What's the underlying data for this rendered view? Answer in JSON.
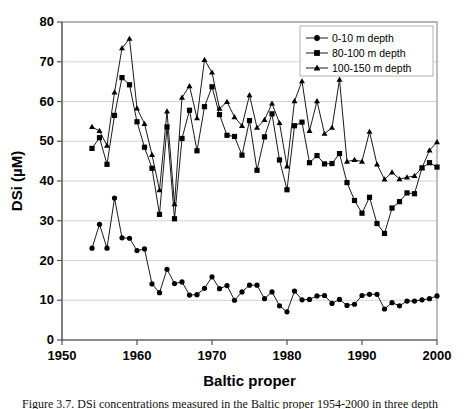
{
  "figure": {
    "caption_partial": "Figure 3.7. DSi concentrations measured in the Baltic proper 1954-2000 in three depth"
  },
  "chart_data": {
    "type": "line",
    "title": "",
    "xlabel": "Baltic proper",
    "ylabel": "DSi (µM)",
    "xlim": [
      1950,
      2000
    ],
    "ylim": [
      0,
      80
    ],
    "xticks": [
      1950,
      1960,
      1970,
      1980,
      1990,
      2000
    ],
    "yticks": [
      0,
      10,
      20,
      30,
      40,
      50,
      60,
      70,
      80
    ],
    "grid": "horizontal",
    "legend_position": "top-right",
    "series": [
      {
        "name": "0-10 m depth",
        "marker": "circle",
        "color": "#000000",
        "x": [
          1954,
          1955,
          1956,
          1957,
          1958,
          1959,
          1960,
          1961,
          1962,
          1963,
          1964,
          1965,
          1966,
          1967,
          1968,
          1969,
          1970,
          1971,
          1972,
          1973,
          1974,
          1975,
          1976,
          1977,
          1978,
          1979,
          1980,
          1981,
          1982,
          1983,
          1984,
          1985,
          1986,
          1987,
          1988,
          1989,
          1990,
          1991,
          1992,
          1993,
          1994,
          1995,
          1996,
          1997,
          1998,
          1999,
          2000
        ],
        "values": [
          23.1,
          29.1,
          23.1,
          35.7,
          25.7,
          25.6,
          22.5,
          22.9,
          14.1,
          11.9,
          17.8,
          14.2,
          14.6,
          11.3,
          11.4,
          13.0,
          15.9,
          12.9,
          13.7,
          10.0,
          12.1,
          13.8,
          13.8,
          10.4,
          12.1,
          8.6,
          7.1,
          12.3,
          10.1,
          10.2,
          11.1,
          11.2,
          9.2,
          10.2,
          8.7,
          9.0,
          11.2,
          11.5,
          11.5,
          7.8,
          9.4,
          8.6,
          9.8,
          9.8,
          10.1,
          10.4,
          11.1
        ]
      },
      {
        "name": "80-100 m depth",
        "marker": "square",
        "color": "#000000",
        "x": [
          1954,
          1955,
          1956,
          1957,
          1958,
          1959,
          1960,
          1961,
          1962,
          1963,
          1964,
          1965,
          1966,
          1967,
          1968,
          1969,
          1970,
          1971,
          1972,
          1973,
          1974,
          1975,
          1976,
          1977,
          1978,
          1979,
          1980,
          1981,
          1982,
          1983,
          1984,
          1985,
          1986,
          1987,
          1988,
          1989,
          1990,
          1991,
          1992,
          1993,
          1994,
          1995,
          1996,
          1997,
          1998,
          1999,
          2000
        ],
        "values": [
          48.2,
          50.9,
          44.2,
          56.5,
          66.0,
          64.2,
          54.9,
          48.5,
          43.2,
          31.6,
          53.6,
          30.5,
          50.7,
          57.8,
          47.6,
          58.7,
          63.7,
          56.7,
          51.5,
          51.2,
          46.5,
          55.2,
          42.7,
          51.1,
          56.9,
          45.3,
          37.8,
          53.9,
          54.8,
          44.6,
          46.4,
          44.3,
          44.4,
          46.9,
          39.6,
          35.1,
          31.9,
          35.9,
          29.3,
          26.8,
          33.2,
          34.8,
          37.0,
          36.8,
          43.3,
          44.6,
          43.5
        ]
      },
      {
        "name": "100-150 m depth",
        "marker": "triangle",
        "color": "#000000",
        "x": [
          1954,
          1955,
          1956,
          1957,
          1958,
          1959,
          1960,
          1961,
          1962,
          1963,
          1964,
          1965,
          1966,
          1967,
          1968,
          1969,
          1970,
          1971,
          1972,
          1973,
          1974,
          1975,
          1976,
          1977,
          1978,
          1979,
          1980,
          1981,
          1982,
          1983,
          1984,
          1985,
          1986,
          1987,
          1988,
          1989,
          1990,
          1991,
          1992,
          1993,
          1994,
          1995,
          1996,
          1997,
          1998,
          1999,
          2000
        ],
        "values": [
          53.6,
          52.6,
          48.9,
          62.3,
          73.4,
          75.8,
          58.3,
          54.4,
          46.6,
          37.7,
          57.5,
          34.2,
          61.0,
          63.9,
          55.8,
          70.5,
          67.3,
          58.2,
          59.9,
          56.1,
          53.9,
          61.6,
          53.4,
          55.4,
          59.5,
          54.6,
          43.7,
          60.1,
          65.1,
          52.6,
          60.1,
          51.9,
          53.4,
          65.5,
          44.9,
          45.3,
          44.9,
          52.4,
          44.2,
          40.4,
          42.2,
          40.5,
          40.9,
          41.3,
          43.3,
          47.7,
          49.8
        ]
      }
    ]
  }
}
